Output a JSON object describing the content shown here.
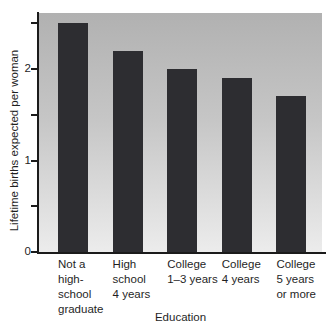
{
  "chart_data": {
    "type": "bar",
    "title": "",
    "xlabel": "Education",
    "ylabel": "Lifetime births expected per woman",
    "categories": [
      "Not a high-school graduate",
      "High school 4 years",
      "College 1–3 years",
      "College 4 years",
      "College 5 years or more"
    ],
    "category_display": [
      "Not a\nhigh-\nschool\ngraduate",
      "High\nschool\n4 years",
      "College\n1–3 years",
      "College\n4 years",
      "College\n5 years\nor more"
    ],
    "values": [
      2.5,
      2.2,
      2.0,
      1.9,
      1.7
    ],
    "series": [
      {
        "name": "Lifetime births expected per woman",
        "values": [
          2.5,
          2.2,
          2.0,
          1.9,
          1.7
        ]
      }
    ],
    "ylim": [
      0,
      2.61
    ],
    "yticks_labeled": [
      0,
      1,
      2
    ],
    "ytick_labels": [
      "0",
      "1",
      "2"
    ],
    "yticks_minor": [
      0.5,
      1.5,
      2.5
    ],
    "grid": false,
    "legend": "none",
    "colors": {
      "bar": "#2d2d31",
      "axis": "#1b1b1b",
      "text": "#1f1f1f",
      "plot_bg_top": "#b1b1b1",
      "plot_bg_bottom": "#ececec",
      "page_bg": "#ffffff"
    }
  }
}
